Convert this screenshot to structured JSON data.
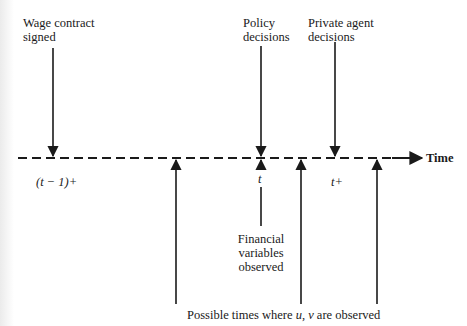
{
  "diagram": {
    "axis_label": "Time",
    "top_events": [
      {
        "id": "wage",
        "line1": "Wage contract",
        "line2": "signed",
        "x": 53
      },
      {
        "id": "policy",
        "line1": "Policy",
        "line2": "decisions",
        "x": 261
      },
      {
        "id": "private",
        "line1": "Private agent",
        "line2": "decisions",
        "x": 335
      }
    ],
    "axis_ticks": {
      "t_minus_1_plus": "(t − 1)+",
      "t": "t",
      "t_plus": "t+"
    },
    "financial": {
      "line1": "Financial",
      "line2": "variables",
      "line3": "observed"
    },
    "bottom_caption": "Possible times where u, v are observed",
    "bottom_caption_parts": {
      "prefix": "Possible times where ",
      "u": "u",
      "sep": ", ",
      "v": "v",
      "suffix": " are observed"
    },
    "observation_arrows_x": [
      176,
      301,
      377
    ],
    "colors": {
      "ink": "#1a1a1a",
      "background": "#ffffff"
    }
  }
}
